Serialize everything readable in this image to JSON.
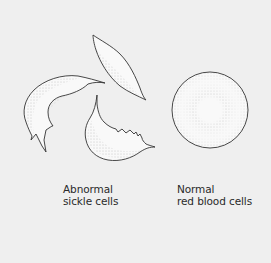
{
  "figure": {
    "colors": {
      "background": "#efefef",
      "outline": "#333333",
      "stipple": "#8a8a8a",
      "cell_fill": "#f9f9f9"
    },
    "groups": [
      {
        "id": "abnormal",
        "label_lines": [
          "Abnormal",
          "sickle cells"
        ],
        "cell_count": 3,
        "shape": "sickle"
      },
      {
        "id": "normal",
        "label_lines": [
          "Normal",
          "red blood cells"
        ],
        "cell_count": 1,
        "shape": "round disc"
      }
    ]
  }
}
